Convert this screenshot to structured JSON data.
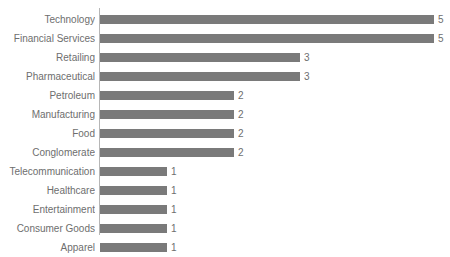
{
  "chart_data": {
    "type": "bar",
    "orientation": "horizontal",
    "title": "",
    "xlabel": "",
    "ylabel": "",
    "categories": [
      "Technology",
      "Financial Services",
      "Retailing",
      "Pharmaceutical",
      "Petroleum",
      "Manufacturing",
      "Food",
      "Conglomerate",
      "Telecommunication",
      "Healthcare",
      "Entertainment",
      "Consumer Goods",
      "Apparel"
    ],
    "values": [
      5,
      5,
      3,
      3,
      2,
      2,
      2,
      2,
      1,
      1,
      1,
      1,
      1
    ],
    "value_labels": [
      "5",
      "5",
      "3",
      "3",
      "2",
      "2",
      "2",
      "2",
      "1",
      "1",
      "1",
      "1",
      "1"
    ],
    "xlim": [
      0,
      5
    ],
    "grid": false,
    "legend": false,
    "bar_color": "#7a7a7a",
    "label_color": "#6e6e6e",
    "axis_color": "#b6b6b6"
  },
  "axis": {
    "category_axis_visible": true,
    "value_axis_visible": false
  }
}
